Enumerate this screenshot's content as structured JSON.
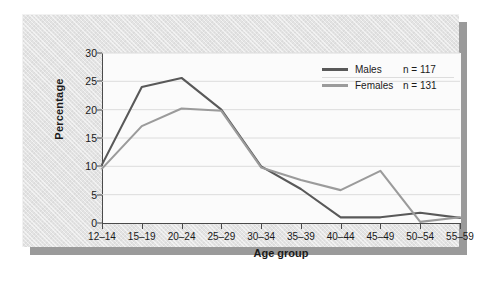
{
  "chart_data": {
    "type": "line",
    "title": "",
    "subtitle": "",
    "xlabel": "Age group",
    "ylabel": "Percentage",
    "categories": [
      "12–14",
      "15–19",
      "20–24",
      "25–29",
      "30–34",
      "35–39",
      "40–44",
      "45–49",
      "50–54",
      "55–59"
    ],
    "ylim": [
      0,
      30
    ],
    "yticks": [
      0,
      5,
      10,
      15,
      20,
      25,
      30
    ],
    "ytick_labels": [
      "0",
      "5",
      "10",
      "15",
      "20",
      "25",
      "30"
    ],
    "grid": "horizontal",
    "legend_position": "top-right",
    "series": [
      {
        "name": "Males",
        "n_label": "n = 117",
        "n": 117,
        "color": "#595959",
        "values": [
          10.3,
          24.0,
          25.6,
          20.0,
          10.0,
          6.0,
          1.0,
          1.0,
          1.8,
          0.9
        ]
      },
      {
        "name": "Females",
        "n_label": "n = 131",
        "n": 131,
        "color": "#9b9b9b",
        "values": [
          9.6,
          17.1,
          20.2,
          19.8,
          9.8,
          7.6,
          5.8,
          9.2,
          0.2,
          1.0
        ]
      }
    ]
  },
  "colors": {
    "card_background": "#e3e3e3",
    "plot_background": "#fbfbfb",
    "axis": "#4a4a4a",
    "gridline": "#dcdcdc",
    "shadow": "#9a9a9a",
    "text": "#1a1a1a"
  }
}
